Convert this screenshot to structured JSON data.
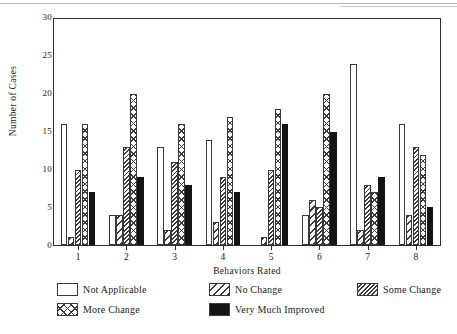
{
  "chart_data": {
    "type": "bar",
    "title": "",
    "xlabel": "Behaviors Rated",
    "ylabel": "Number of Cases",
    "categories": [
      "1",
      "2",
      "3",
      "4",
      "5",
      "6",
      "7",
      "8"
    ],
    "ylim": [
      0,
      30
    ],
    "yticks": [
      0,
      5,
      10,
      15,
      20,
      25,
      30
    ],
    "ytick_labels": [
      "0",
      "5",
      "10",
      "15",
      "20",
      "25",
      "30"
    ],
    "grid": false,
    "legend_position": "below-plot",
    "series": [
      {
        "name": "Not Applicable",
        "pattern": "empty",
        "values": [
          16,
          4,
          13,
          14,
          0,
          4,
          24,
          16
        ]
      },
      {
        "name": "No Change",
        "pattern": "wide-diagonal-hatch",
        "values": [
          1,
          4,
          2,
          3,
          1,
          6,
          2,
          4
        ]
      },
      {
        "name": "Some Change",
        "pattern": "dense-diagonal-hatch",
        "values": [
          10,
          13,
          11,
          9,
          10,
          5,
          8,
          13
        ]
      },
      {
        "name": "More Change",
        "pattern": "cross-hatch",
        "values": [
          16,
          20,
          16,
          17,
          18,
          20,
          7,
          12
        ]
      },
      {
        "name": "Very Much Improved",
        "pattern": "solid-black",
        "values": [
          7,
          9,
          8,
          7,
          16,
          15,
          9,
          5
        ]
      }
    ]
  },
  "axes": {
    "y_title": "Number of Cases",
    "x_title": "Behaviors Rated"
  },
  "legend": {
    "items": [
      {
        "label": "Not Applicable",
        "pattern": "empty"
      },
      {
        "label": "No Change",
        "pattern": "wide-diagonal-hatch"
      },
      {
        "label": "Some Change",
        "pattern": "dense-diagonal-hatch"
      },
      {
        "label": "More Change",
        "pattern": "cross-hatch"
      },
      {
        "label": "Very Much Improved",
        "pattern": "solid-black"
      }
    ]
  },
  "colors": {
    "ink": "#2e2e2e",
    "solid_bar": "#141414",
    "background": "#ffffff"
  }
}
